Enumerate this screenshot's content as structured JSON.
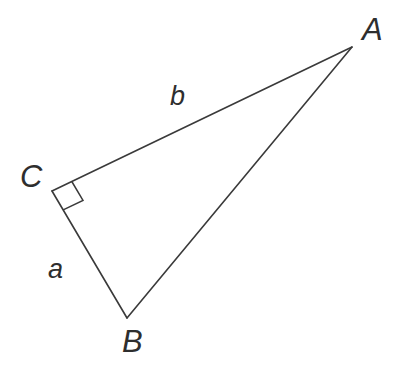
{
  "figure": {
    "type": "right-triangle",
    "background_color": "#ffffff",
    "stroke_color": "#3a3a3a",
    "label_color": "#2e2e2e",
    "stroke_width": 1.6,
    "canvas": {
      "width": 396,
      "height": 376
    }
  },
  "vertices": [
    {
      "name": "A",
      "label": "A",
      "x": 352,
      "y": 47,
      "label_x": 362,
      "label_y": 14
    },
    {
      "name": "B",
      "label": "B",
      "x": 127,
      "y": 318,
      "label_x": 122,
      "label_y": 326
    },
    {
      "name": "C",
      "label": "C",
      "x": 52,
      "y": 191,
      "label_x": 20,
      "label_y": 161
    }
  ],
  "sides": [
    {
      "name": "side-a",
      "label": "a",
      "from": "C",
      "to": "B",
      "label_x": 48,
      "label_y": 256
    },
    {
      "name": "side-b",
      "label": "b",
      "from": "C",
      "to": "A",
      "label_x": 170,
      "label_y": 83
    },
    {
      "name": "side-c",
      "label": "",
      "from": "B",
      "to": "A",
      "label_x": null,
      "label_y": null
    }
  ],
  "right_angle": {
    "at_vertex": "C",
    "marker": "square",
    "size": 22,
    "points": "52,191 73,201 63,222 42,212"
  },
  "paths": {
    "triangle": "M 352,47 L 52,191 L 127,318 Z",
    "right_angle_square": "M 73,201 L 63,222 L 42,212 L 52,191"
  }
}
